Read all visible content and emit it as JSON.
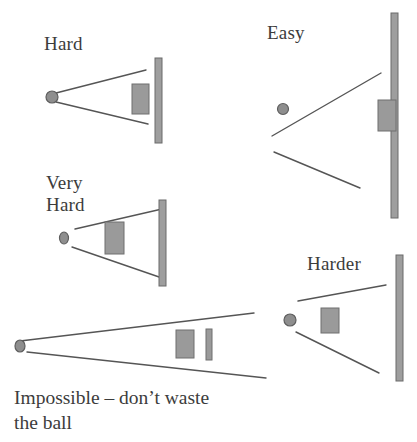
{
  "figure": {
    "background_color": "#ffffff",
    "stroke_color": "#555555",
    "block_fill": "#9a9a9a",
    "block_stroke": "#6f6f6f",
    "wall_fill": "#9e9e9e",
    "wall_stroke": "#6a6a6a",
    "ball_fill": "#8e8e8e",
    "ball_stroke": "#5e5e5e"
  },
  "diagrams": [
    {
      "id": "hard",
      "label": "Hard",
      "label_x": 44,
      "label_y": 33,
      "ball": {
        "cx": 52,
        "cy": 97,
        "rx": 6,
        "ry": 6
      },
      "cone": [
        {
          "x1": 56,
          "y1": 93,
          "x2": 146,
          "y2": 70
        },
        {
          "x1": 56,
          "y1": 102,
          "x2": 148,
          "y2": 124
        }
      ],
      "block": {
        "x": 132,
        "y": 84,
        "w": 17,
        "h": 30
      },
      "wall": {
        "x": 155,
        "y": 58,
        "w": 7,
        "h": 85
      }
    },
    {
      "id": "easy",
      "label": "Easy",
      "label_x": 267,
      "label_y": 22,
      "ball": {
        "cx": 283,
        "cy": 109,
        "rx": 5.5,
        "ry": 5.5
      },
      "cone": [
        {
          "x1": 272,
          "y1": 136,
          "x2": 381,
          "y2": 73
        },
        {
          "x1": 274,
          "y1": 152,
          "x2": 360,
          "y2": 188
        }
      ],
      "block": {
        "x": 378,
        "y": 100,
        "w": 18,
        "h": 31
      },
      "wall": {
        "x": 391,
        "y": 13,
        "w": 7,
        "h": 205
      }
    },
    {
      "id": "very-hard",
      "label": "Very\nHard",
      "label_x": 46,
      "label_y": 172,
      "ball": {
        "cx": 64,
        "cy": 238,
        "rx": 4.5,
        "ry": 6
      },
      "cone": [
        {
          "x1": 75,
          "y1": 229,
          "x2": 162,
          "y2": 209
        },
        {
          "x1": 72,
          "y1": 247,
          "x2": 162,
          "y2": 278
        }
      ],
      "block": {
        "x": 105,
        "y": 222,
        "w": 19,
        "h": 32
      },
      "wall": {
        "x": 159,
        "y": 200,
        "w": 7,
        "h": 86
      }
    },
    {
      "id": "harder",
      "label": "Harder",
      "label_x": 307,
      "label_y": 253,
      "ball": {
        "cx": 290,
        "cy": 320,
        "rx": 6,
        "ry": 6
      },
      "cone": [
        {
          "x1": 298,
          "y1": 301,
          "x2": 386,
          "y2": 285
        },
        {
          "x1": 296,
          "y1": 332,
          "x2": 379,
          "y2": 373
        }
      ],
      "block": {
        "x": 321,
        "y": 308,
        "w": 18,
        "h": 25
      },
      "wall": {
        "x": 396,
        "y": 255,
        "w": 7,
        "h": 126
      }
    },
    {
      "id": "impossible",
      "label": "",
      "ball": {
        "cx": 20,
        "cy": 346,
        "rx": 5,
        "ry": 6
      },
      "cone": [
        {
          "x1": 20,
          "y1": 341,
          "x2": 254,
          "y2": 313
        },
        {
          "x1": 27,
          "y1": 352,
          "x2": 266,
          "y2": 378
        }
      ],
      "block": {
        "x": 176,
        "y": 330,
        "w": 18,
        "h": 28
      },
      "bar": {
        "x": 206,
        "y": 329,
        "w": 6,
        "h": 31
      }
    }
  ],
  "caption": {
    "line1": "Impossible – don’t waste",
    "line2": "the ball"
  }
}
